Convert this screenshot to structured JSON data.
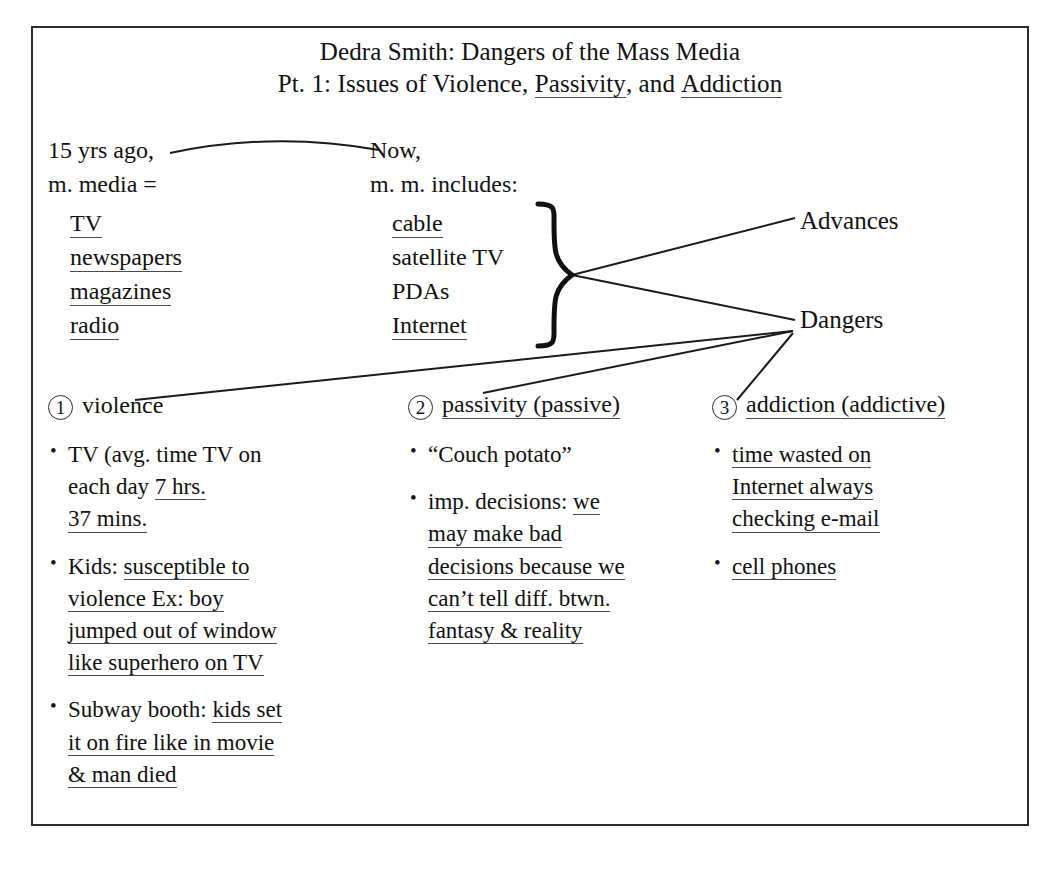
{
  "document": {
    "title_lines": [
      "Dedra Smith: Dangers of the Mass Media",
      "Pt. 1: Issues of Violence, Passivity, and Addiction"
    ],
    "title_line1": "Dedra Smith: Dangers of the Mass Media",
    "title_line2_prefix": "Pt. 1: Issues of Violence, ",
    "title_line2_underlined_a": "Passivity",
    "title_line2_mid": ", and ",
    "title_line2_underlined_b": "Addiction"
  },
  "compare": {
    "then": {
      "heading_line1": "15 yrs ago,",
      "heading_line2": "m. media =",
      "items": [
        "TV",
        "newspapers",
        "magazines",
        "radio"
      ],
      "items_underlined": [
        true,
        true,
        true,
        true
      ]
    },
    "now": {
      "heading_line1": "Now,",
      "heading_line2": "m. m. includes:",
      "items": [
        "cable",
        "satellite TV",
        "PDAs",
        "Internet"
      ],
      "items_underlined": [
        true,
        false,
        false,
        true
      ]
    }
  },
  "branches": {
    "advances": "Advances",
    "dangers": "Dangers"
  },
  "sections": [
    {
      "number": "1",
      "heading": "violence",
      "heading_underlined": false,
      "bullets": [
        {
          "lines": [
            {
              "plain": "TV (avg. time TV on",
              "underlined": ""
            },
            {
              "plain": "each day ",
              "underlined": "7 hrs."
            },
            {
              "plain": "",
              "underlined": "37 mins."
            }
          ]
        },
        {
          "lines": [
            {
              "plain": "Kids: ",
              "underlined": "susceptible to"
            },
            {
              "plain": "",
              "underlined": "violence Ex: boy"
            },
            {
              "plain": "",
              "underlined": "jumped out of window"
            },
            {
              "plain": "",
              "underlined": "like superhero on TV"
            }
          ]
        },
        {
          "lines": [
            {
              "plain": "Subway booth: ",
              "underlined": "kids set"
            },
            {
              "plain": "",
              "underlined": "it on fire like in movie"
            },
            {
              "plain": "",
              "underlined": "& man died"
            }
          ]
        }
      ]
    },
    {
      "number": "2",
      "heading": "passivity (passive)",
      "heading_underlined": true,
      "bullets": [
        {
          "lines": [
            {
              "plain": "“Couch potato”",
              "underlined": ""
            }
          ]
        },
        {
          "lines": [
            {
              "plain": "imp. decisions: ",
              "underlined": "we"
            },
            {
              "plain": "",
              "underlined": "may make bad"
            },
            {
              "plain": "",
              "underlined": "decisions because we"
            },
            {
              "plain": "",
              "underlined": "can’t tell diff. btwn."
            },
            {
              "plain": "",
              "underlined": "fantasy & reality"
            }
          ]
        }
      ]
    },
    {
      "number": "3",
      "heading": "addiction (addictive)",
      "heading_underlined": true,
      "bullets": [
        {
          "lines": [
            {
              "plain": "",
              "underlined": "time wasted on"
            },
            {
              "plain": "",
              "underlined": "Internet always"
            },
            {
              "plain": "",
              "underlined": "checking e-mail"
            }
          ]
        },
        {
          "lines": [
            {
              "plain": "",
              "underlined": "cell phones"
            }
          ]
        }
      ]
    }
  ],
  "colors": {
    "ink": "#111111",
    "frame": "#2c2c2c",
    "underline": "#3a3a3a",
    "paper": "#ffffff"
  }
}
